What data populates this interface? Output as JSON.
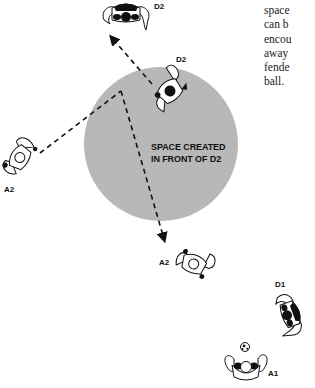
{
  "diagram": {
    "space_label": {
      "line1": "SPACE CREATED",
      "line2": "IN FRONT OF D2"
    },
    "players": [
      {
        "id": "d2_top",
        "label": "D2",
        "team": "defender"
      },
      {
        "id": "d2_mid",
        "label": "D2",
        "team": "defender"
      },
      {
        "id": "a2_left",
        "label": "A2",
        "team": "attacker"
      },
      {
        "id": "a2_mid",
        "label": "A2",
        "team": "attacker"
      },
      {
        "id": "d1",
        "label": "D1",
        "team": "defender"
      },
      {
        "id": "a1",
        "label": "A1",
        "team": "attacker"
      }
    ],
    "ball": {
      "icon": "soccer-ball-icon"
    },
    "colors": {
      "space_circle": "#b8b8b8",
      "ink": "#111111",
      "background": "#ffffff"
    }
  },
  "side_text": {
    "lines": [
      "space",
      "can b",
      "encou",
      "away",
      "fende",
      "ball."
    ]
  }
}
